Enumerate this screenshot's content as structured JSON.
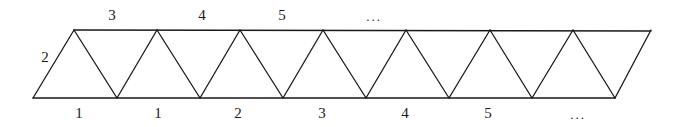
{
  "diagram": {
    "type": "triangle-strip",
    "stroke_color": "#1a1a1a",
    "bottom_vertices_x": [
      33,
      117,
      200,
      283,
      366,
      449,
      532,
      615
    ],
    "bottom_y": 98,
    "top_vertices_x": [
      74,
      157,
      240,
      323,
      406,
      490,
      573,
      651
    ],
    "top_y": 30,
    "left_edge_label": "2",
    "top_labels": [
      {
        "text": "3",
        "x": 112,
        "y": 15
      },
      {
        "text": "4",
        "x": 202,
        "y": 15
      },
      {
        "text": "5",
        "x": 282,
        "y": 15
      },
      {
        "text": "...",
        "x": 374,
        "y": 16
      }
    ],
    "bottom_labels": [
      {
        "text": "1",
        "x": 79,
        "y": 113
      },
      {
        "text": "1",
        "x": 158,
        "y": 113
      },
      {
        "text": "2",
        "x": 238,
        "y": 113
      },
      {
        "text": "3",
        "x": 322,
        "y": 113
      },
      {
        "text": "4",
        "x": 405,
        "y": 113
      },
      {
        "text": "5",
        "x": 488,
        "y": 113
      },
      {
        "text": "...",
        "x": 578,
        "y": 114
      }
    ]
  }
}
